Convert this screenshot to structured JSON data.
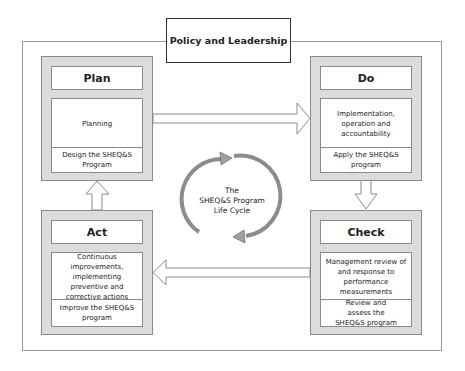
{
  "title": "Policy and Leadership",
  "cycle": {
    "label_lines": [
      "The",
      "SHEQ&S Program",
      "Life Cycle"
    ]
  },
  "stages": {
    "plan": {
      "title": "Plan",
      "description": "Planning",
      "action": "Design the SHEQ&S Program"
    },
    "do": {
      "title": "Do",
      "description": "Implementation, operation and accountability",
      "action": "Apply the SHEQ&S program"
    },
    "check": {
      "title": "Check",
      "description": "Management review of and response to performance measurements",
      "action": "Review and assess the SHEQ&S program"
    },
    "act": {
      "title": "Act",
      "description": "Continuous improvements, implementing preventive and corrective actions",
      "action": "Improve the SHEQ&S program"
    }
  },
  "flow": [
    "Plan → Do",
    "Do → Check",
    "Check → Act",
    "Act → Plan"
  ],
  "colors": {
    "panel": "#dcdcdc",
    "border": "#8a8a8a",
    "cycle_arrow": "#8c8c8c"
  }
}
